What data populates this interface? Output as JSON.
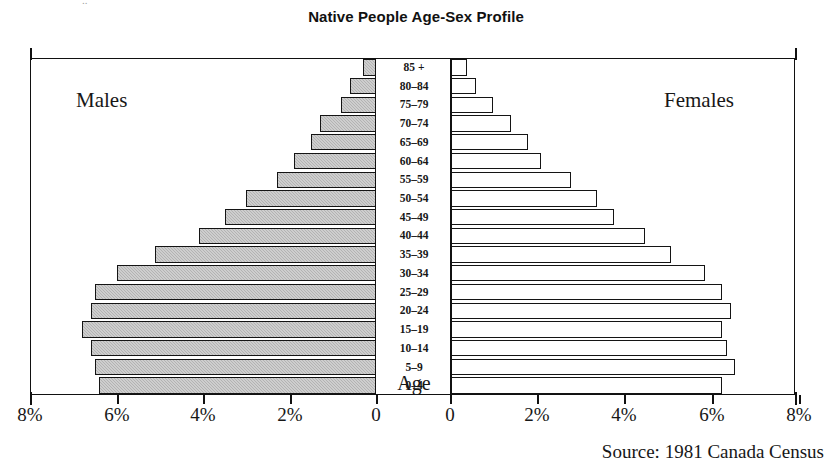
{
  "chart_data": {
    "type": "bar",
    "subtype": "population-pyramid",
    "title": "Native People Age-Sex Profile",
    "xlabel": "",
    "ylabel": "Age",
    "axis_caption": "Age",
    "source": "Source: 1981 Canada Census",
    "grid": false,
    "legend_position": "in-plot",
    "xlim_left": [
      8,
      0
    ],
    "xlim_right": [
      0,
      8
    ],
    "unit": "%",
    "categories": [
      "85 +",
      "80–84",
      "75–79",
      "70–74",
      "65–69",
      "60–64",
      "55–59",
      "50–54",
      "45–49",
      "40–44",
      "35–39",
      "30–34",
      "25–29",
      "20–24",
      "15–19",
      "10–14",
      "5–9",
      "0–4"
    ],
    "series": [
      {
        "name": "Males",
        "side": "left",
        "fill": "#b3b3b3",
        "values": [
          0.3,
          0.6,
          0.8,
          1.3,
          1.5,
          1.9,
          2.3,
          3.0,
          3.5,
          4.1,
          5.1,
          6.0,
          6.5,
          6.6,
          6.8,
          6.6,
          6.5,
          6.4
        ]
      },
      {
        "name": "Females",
        "side": "right",
        "fill": "#ffffff",
        "values": [
          0.4,
          0.6,
          1.0,
          1.4,
          1.8,
          2.1,
          2.8,
          3.4,
          3.8,
          4.5,
          5.1,
          5.9,
          6.3,
          6.5,
          6.3,
          6.4,
          6.6,
          6.3
        ]
      }
    ],
    "x_ticks_left": [
      "8%",
      "6%",
      "4%",
      "2%",
      "0"
    ],
    "x_ticks_right": [
      "0",
      "2%",
      "4%",
      "6%",
      "8%"
    ]
  },
  "axes": {
    "left_panel": {
      "tick_positions_px": [
        30,
        117,
        203,
        290,
        376
      ],
      "labels": [
        "8%",
        "6%",
        "4%",
        "2%",
        "0"
      ]
    },
    "right_panel": {
      "tick_positions_px": [
        450,
        537,
        624,
        712,
        799
      ],
      "labels": [
        "0",
        "2%",
        "4%",
        "6%",
        "8%"
      ]
    }
  },
  "artifact": {
    "clipped_text": ".."
  }
}
